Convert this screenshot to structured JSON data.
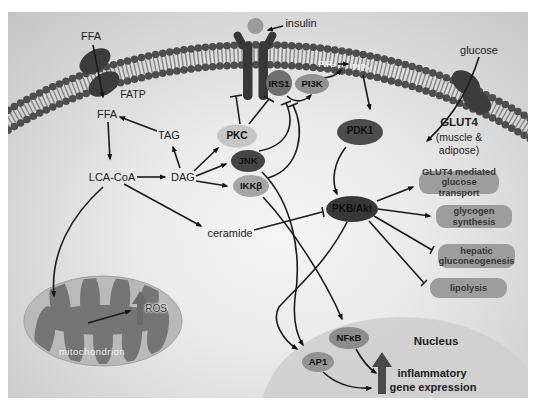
{
  "extracellular": {
    "ffa_label": "FFA",
    "insulin_label": "insulin",
    "glucose_label": "glucose"
  },
  "membrane": {
    "fatp_label": "FATP",
    "pip2_label": "PIP₂",
    "pip3_label": "PIP₃",
    "glut4_label": "GLUT4",
    "glut4_sub1": "(muscle &",
    "glut4_sub2": "adipose)"
  },
  "cytosol": {
    "ffa_label": "FFA",
    "lca_coa_label": "LCA-CoA",
    "tag_label": "TAG",
    "dag_label": "DAG",
    "ceramide_label": "ceramide",
    "irs1_label": "IRS1",
    "pi3k_label": "PI3K",
    "pdk1_label": "PDK1",
    "pkc_label": "PKC",
    "jnk_label": "JNK",
    "ikkb_label": "IKKβ",
    "pkb_label": "PKB/Akt"
  },
  "outcomes": [
    "GLUT4 mediated glucose transport",
    "glycogen synthesis",
    "hepatic gluconeogenesis",
    "lipolysis"
  ],
  "mitochondrion": {
    "name_label": "mitochondrion",
    "ros_label": "ROS"
  },
  "nucleus": {
    "name_label": "Nucleus",
    "nfkb_label": "NFκB",
    "ap1_label": "AP1",
    "gene_line1": "inflammatory",
    "gene_line2": "gene expression"
  },
  "colors": {
    "membrane_bead": "#4e4e4e",
    "membrane_tail": "#858585",
    "dark_node": "#3a3a3a",
    "light_node": "#c6c6c6",
    "outcome_box": "#9d9d9d",
    "nucleus_fill": "#d0d0d0",
    "mito_outer": "#b9b9b9",
    "mito_cristae": "#757575",
    "line": "#1c1c1c",
    "background_edge": "#c5c5c5"
  }
}
